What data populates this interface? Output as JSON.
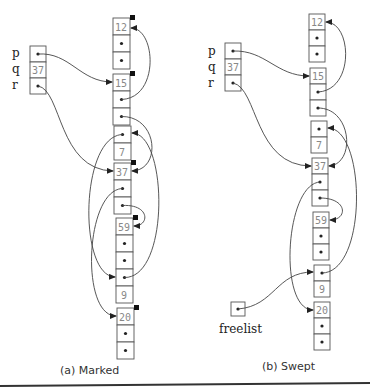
{
  "figure": {
    "panels": [
      {
        "id": "a",
        "caption": "(a) Marked",
        "roots": {
          "labels": [
            "p",
            "q",
            "r"
          ],
          "q_value": "37"
        },
        "objects": [
          {
            "value": "12",
            "marked": true
          },
          {
            "value": "15",
            "marked": true
          },
          {
            "value": "7",
            "marked": false
          },
          {
            "value": "37",
            "marked": true
          },
          {
            "value": "59",
            "marked": true
          },
          {
            "value": "9",
            "marked": false
          },
          {
            "value": "20",
            "marked": true
          }
        ]
      },
      {
        "id": "b",
        "caption": "(b) Swept",
        "roots": {
          "labels": [
            "p",
            "q",
            "r"
          ],
          "q_value": "37"
        },
        "objects": [
          {
            "value": "12"
          },
          {
            "value": "15"
          },
          {
            "value": "7"
          },
          {
            "value": "37"
          },
          {
            "value": "59"
          },
          {
            "value": "9"
          },
          {
            "value": "20"
          }
        ],
        "freelist_label": "freelist"
      }
    ]
  }
}
